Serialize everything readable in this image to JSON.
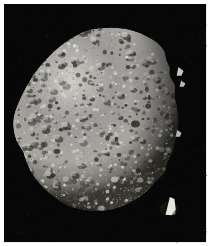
{
  "image": {
    "subject_name": "asteroid-bennu",
    "description": "Grayscale spacecraft photograph of a small rubble-pile asteroid against black space",
    "width": 210,
    "height": 246,
    "frame": {
      "border_color": "#ffffff",
      "border_top_px": 4,
      "border_left_px": 4,
      "border_right_px": 0,
      "border_bottom_px": 0
    },
    "sky": {
      "label": "space-background",
      "color": "#070707",
      "color_variation_low": "#030303",
      "color_variation_high": "#111111"
    },
    "body": {
      "label": "asteroid-body",
      "shape": "spheroid-diamond",
      "base_color": "#9c9a96",
      "sunlit_color": "#cfcdc8",
      "midtone_color": "#a8a6a1",
      "shadow_color": "#38372f",
      "terminator_color": "#16150f",
      "outline": [
        [
          112,
          28
        ],
        [
          128,
          29
        ],
        [
          142,
          33
        ],
        [
          152,
          38
        ],
        [
          160,
          44
        ],
        [
          166,
          52
        ],
        [
          170,
          60
        ],
        [
          172,
          68
        ],
        [
          174,
          76
        ],
        [
          176,
          86
        ],
        [
          178,
          96
        ],
        [
          180,
          106
        ],
        [
          181,
          116
        ],
        [
          181,
          126
        ],
        [
          180,
          136
        ],
        [
          178,
          146
        ],
        [
          175,
          156
        ],
        [
          171,
          166
        ],
        [
          166,
          176
        ],
        [
          160,
          185
        ],
        [
          152,
          193
        ],
        [
          143,
          200
        ],
        [
          133,
          206
        ],
        [
          122,
          211
        ],
        [
          110,
          214
        ],
        [
          98,
          215
        ],
        [
          86,
          214
        ],
        [
          74,
          211
        ],
        [
          63,
          206
        ],
        [
          53,
          199
        ],
        [
          44,
          191
        ],
        [
          36,
          182
        ],
        [
          30,
          172
        ],
        [
          26,
          163
        ],
        [
          24,
          155
        ],
        [
          20,
          149
        ],
        [
          16,
          142
        ],
        [
          14,
          134
        ],
        [
          13,
          126
        ],
        [
          14,
          117
        ],
        [
          17,
          108
        ],
        [
          21,
          99
        ],
        [
          26,
          89
        ],
        [
          32,
          79
        ],
        [
          39,
          69
        ],
        [
          47,
          60
        ],
        [
          56,
          51
        ],
        [
          66,
          43
        ],
        [
          77,
          36
        ],
        [
          89,
          31
        ],
        [
          100,
          28
        ]
      ],
      "right_limb_roughness": {
        "label": "boulder-strewn-limb",
        "start_y": 40,
        "end_y": 190,
        "amplitude_px": 6
      }
    },
    "features": [
      {
        "name": "benben-boulder",
        "type": "bright-angular-boulder",
        "x": 171,
        "y": 203,
        "w": 13,
        "h": 16,
        "color": "#e8e6e0"
      },
      {
        "name": "bright-limb-boulder-upper",
        "type": "bright-protruding-boulder",
        "x": 180,
        "y": 68,
        "w": 7,
        "h": 9,
        "color": "#dcdad4"
      },
      {
        "name": "bright-limb-boulder-mid",
        "type": "bright-protruding-boulder",
        "x": 183,
        "y": 82,
        "w": 6,
        "h": 6,
        "color": "#cfcdc6"
      },
      {
        "name": "bright-limb-boulder-lower",
        "type": "bright-protruding-boulder",
        "x": 179,
        "y": 132,
        "w": 6,
        "h": 7,
        "color": "#cbc9c2"
      },
      {
        "name": "dark-crater-central",
        "type": "dark-depression",
        "x": 138,
        "y": 126,
        "w": 9,
        "h": 7,
        "color": "#2c2b26"
      },
      {
        "name": "dark-crater-upper-right",
        "type": "dark-depression",
        "x": 151,
        "y": 108,
        "w": 6,
        "h": 5,
        "color": "#33322c"
      },
      {
        "name": "dark-crater-left",
        "type": "dark-depression",
        "x": 58,
        "y": 154,
        "w": 7,
        "h": 5,
        "color": "#34332d"
      },
      {
        "name": "terminator-shadow",
        "type": "shadow-region",
        "description": "dark unlit crescent across lower-left and lower-right limb"
      }
    ],
    "texture": {
      "label": "regolith-boulder-field",
      "grain_count": 2600,
      "dark_speck_count": 420,
      "bright_speck_count": 520,
      "boulder_count": 150,
      "seed": 20181203
    },
    "lighting": {
      "sun_direction": "upper-left",
      "highlight_x": 72,
      "highlight_y": 82,
      "highlight_radius": 118
    }
  }
}
